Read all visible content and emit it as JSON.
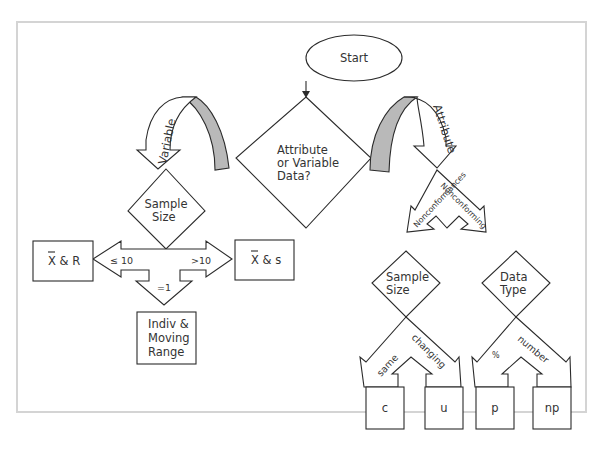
{
  "diagram": {
    "start": {
      "label": "Start"
    },
    "main_decision": {
      "lines": [
        "Attribute",
        "or Variable",
        "Data?"
      ]
    },
    "branches": {
      "variable": "Variable",
      "attribute": "Attribute"
    },
    "variable_side": {
      "decision": {
        "lines": [
          "Sample",
          "Size"
        ]
      },
      "le10": "≤ 10",
      "gt10": ">10",
      "eq1": "=1",
      "xbar_r": {
        "symbol": "X",
        "rest": " & R"
      },
      "xbar_s": {
        "symbol": "X",
        "rest": " & s"
      },
      "indiv": {
        "lines": [
          "Indiv &",
          "Moving",
          "Range"
        ]
      }
    },
    "attribute_side": {
      "nonconformances": "Nonconformances",
      "nonconforming": "Nonconforming",
      "sample_size": {
        "lines": [
          "Sample",
          "Size"
        ]
      },
      "data_type": {
        "lines": [
          "Data",
          "Type"
        ]
      },
      "same": "same",
      "changing": "changing",
      "percent": "%",
      "number": "number",
      "charts": [
        "c",
        "u",
        "p",
        "np"
      ]
    }
  }
}
